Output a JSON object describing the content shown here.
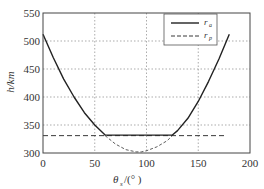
{
  "chart_data": {
    "type": "line",
    "title": "",
    "xlabel": "θ_s/(°)",
    "ylabel": "h/km",
    "xlim": [
      0,
      200
    ],
    "ylim": [
      300,
      550
    ],
    "xticks": [
      0,
      50,
      100,
      150,
      200
    ],
    "yticks": [
      300,
      350,
      400,
      450,
      500,
      550
    ],
    "grid": true,
    "legend_position": "upper right",
    "series": [
      {
        "name": "r_a",
        "style": "solid",
        "x": [
          0,
          10,
          20,
          30,
          40,
          50,
          60,
          70,
          80,
          90,
          100,
          110,
          120,
          125,
          130,
          140,
          150,
          160,
          170,
          180
        ],
        "y": [
          512,
          470,
          432,
          400,
          372,
          350,
          332,
          332,
          332,
          332,
          332,
          332,
          332,
          332,
          340,
          362,
          392,
          428,
          468,
          512
        ]
      },
      {
        "name": "r_p",
        "style": "dashed",
        "x": [
          0,
          60,
          70,
          80,
          90,
          95,
          100,
          110,
          120,
          125,
          175
        ],
        "y": [
          331,
          331,
          316,
          306,
          302,
          302,
          304,
          311,
          322,
          331,
          331
        ],
        "note": "horizontal dashed line at ~331 km from 0 to ~175°, with a dashed dip to ~302 km between ~60° and ~125°"
      }
    ]
  },
  "legend": {
    "items": [
      {
        "label": "r",
        "subscript": "a",
        "style": "solid"
      },
      {
        "label": "r",
        "subscript": "p",
        "style": "dashed"
      }
    ]
  },
  "axes": {
    "x_label_main": "θ",
    "x_label_sub": "s",
    "x_label_unit": "/(°  )",
    "y_label": "h/km",
    "x_tick_labels": [
      "0",
      "50",
      "100",
      "150",
      "200"
    ],
    "y_tick_labels": [
      "300",
      "350",
      "400",
      "450",
      "500",
      "550"
    ]
  },
  "colors": {
    "line": "#222222",
    "grid": "#888888",
    "axis": "#444444"
  }
}
